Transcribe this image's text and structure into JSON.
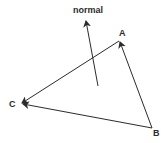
{
  "diagram": {
    "labels": {
      "normal": "normal",
      "a": "A",
      "b": "B",
      "c": "C"
    },
    "colors": {
      "stroke": "#2b2b2b",
      "background": "#ffffff"
    }
  }
}
